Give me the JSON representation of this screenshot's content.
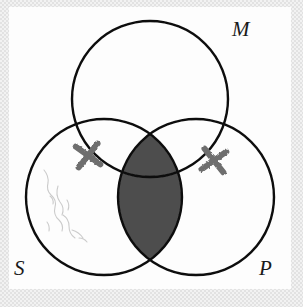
{
  "figure": {
    "kind": "syllogism-venn-diagram",
    "circle_count": 3,
    "labels": {
      "top": "M",
      "bottom_left": "S",
      "bottom_right": "P"
    },
    "colors": {
      "stroke": "#111111",
      "shading": "#4e4e4e",
      "mark": "#6e6e6e",
      "page": "#fdfdfd",
      "margin": "#e8e8e8"
    },
    "circles": [
      {
        "name": "M",
        "cx": 150,
        "cy": 99,
        "r": 78
      },
      {
        "name": "S",
        "cx": 104,
        "cy": 197,
        "r": 78
      },
      {
        "name": "P",
        "cx": 196,
        "cy": 197,
        "r": 78
      }
    ],
    "shaded_regions": [
      {
        "name": "S-and-P-lens",
        "description": "entire intersection of S and P, both inside and outside M",
        "fill": "#4e4e4e"
      }
    ],
    "marks": [
      {
        "name": "x-mark-left",
        "symbol": "X",
        "x": 88,
        "y": 155,
        "on_boundary": "S-and-M",
        "color": "#6e6e6e"
      },
      {
        "name": "x-mark-right",
        "symbol": "X",
        "x": 214,
        "y": 160,
        "on_boundary": "P-and-M",
        "color": "#6e6e6e"
      }
    ],
    "pencil_smudge": {
      "name": "erasure-smudge",
      "region": "S-only",
      "description": "faint light grey pencil erasure marks"
    }
  }
}
